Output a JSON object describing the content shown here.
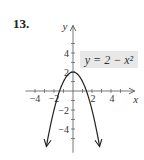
{
  "problem_number": "13.",
  "chart_data": {
    "type": "line",
    "title": "",
    "annotation": "y = 2 − x²",
    "function": "2 - x^2",
    "xlabel": "x",
    "ylabel": "y",
    "xlim": [
      -5,
      6.5
    ],
    "ylim": [
      -6.5,
      6.9
    ],
    "x_ticks": [
      -4,
      -3,
      -2,
      -1,
      1,
      2,
      3,
      4,
      5
    ],
    "y_ticks": [
      -5,
      -4,
      -3,
      -2,
      -1,
      1,
      2,
      3,
      4,
      5
    ],
    "x_tick_labels": [
      {
        "value": -4,
        "label": "−4"
      },
      {
        "value": -2,
        "label": "−2"
      },
      {
        "value": 2,
        "label": "2"
      },
      {
        "value": 4,
        "label": "4"
      }
    ],
    "y_tick_labels": [
      {
        "value": 4,
        "label": "4"
      },
      {
        "value": 2,
        "label": "2"
      },
      {
        "value": -2,
        "label": "−2"
      },
      {
        "value": -4,
        "label": "−4"
      }
    ],
    "curve_domain": [
      -2.8,
      2.8
    ],
    "vertex": {
      "x": 0,
      "y": 2
    },
    "grid": false,
    "curve_arrows": true,
    "colors": {
      "curve": "#222222",
      "axis": "#555555",
      "label_box": "#e8e8e8"
    }
  }
}
